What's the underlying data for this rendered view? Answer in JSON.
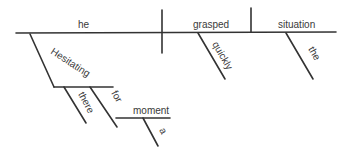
{
  "diagram": {
    "type": "sentence-diagram",
    "style": "Reed-Kellogg",
    "ink_color": "#333333",
    "background": "#ffffff",
    "baseline": {
      "subject": "he",
      "verb": "grasped",
      "direct_object": "situation"
    },
    "modifiers": [
      {
        "word": "quickly",
        "modifies": "grasped",
        "role": "adverb"
      },
      {
        "word": "the",
        "modifies": "situation",
        "role": "article"
      },
      {
        "word": "Hesitating",
        "modifies": "he",
        "role": "participle"
      },
      {
        "word": "there",
        "modifies": "Hesitating",
        "role": "adverb"
      },
      {
        "word": "for",
        "modifies": "Hesitating",
        "role": "preposition",
        "object": "moment"
      },
      {
        "word": "a",
        "modifies": "moment",
        "role": "article"
      }
    ],
    "labels": {
      "he": "he",
      "grasped": "grasped",
      "situation": "situation",
      "quickly": "quickly",
      "the": "the",
      "hesitating": "Hesitating",
      "there": "there",
      "for": "for",
      "moment": "moment",
      "a": "a"
    }
  }
}
